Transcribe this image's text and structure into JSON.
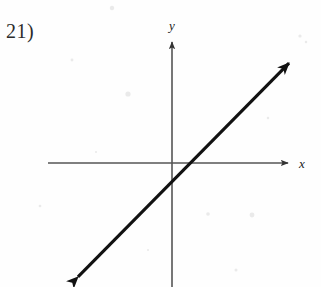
{
  "figure": {
    "problem_number": "21)",
    "background_color": "#fefefe",
    "axis_color": "#555555",
    "line_color": "#111111",
    "label_color": "#222222"
  },
  "axes": {
    "x_label": "x",
    "y_label": "y",
    "x_axis": {
      "x1": 48,
      "y1": 163,
      "x2": 293,
      "y2": 163
    },
    "y_axis": {
      "x1": 172,
      "y1": 37,
      "x2": 172,
      "y2": 287
    },
    "x_label_pos": {
      "x": 302,
      "y": 168
    },
    "y_label_pos": {
      "x": 167,
      "y": 30
    }
  },
  "chart_data": {
    "type": "line",
    "title": "",
    "xlabel": "x",
    "ylabel": "y",
    "grid": false,
    "legend": "none",
    "origin_px": {
      "x": 172,
      "y": 163
    },
    "axis_arrows": [
      "x-positive",
      "y-positive"
    ],
    "series": [
      {
        "name": "line",
        "style": "solid",
        "arrows": "both",
        "slope": 1,
        "x_intercept": 0.7,
        "y_intercept": -0.7,
        "endpoints_px": [
          {
            "x": 72,
            "y": 283
          },
          {
            "x": 295,
            "y": 57
          }
        ],
        "points": [
          {
            "x": -4.6,
            "y": -5.3
          },
          {
            "x": 5.6,
            "y": 4.9
          }
        ]
      }
    ],
    "xlim": [
      -5.7,
      5.6
    ],
    "ylim": [
      -5.6,
      5.7
    ]
  }
}
